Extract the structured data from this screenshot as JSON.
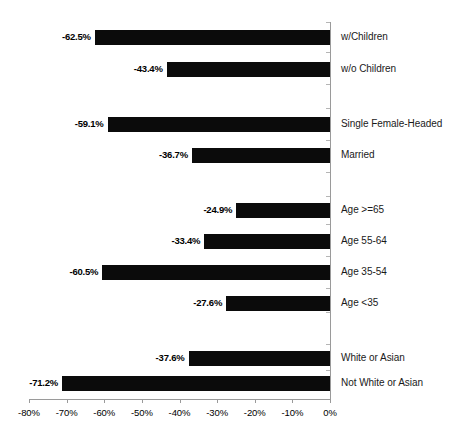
{
  "chart_data": {
    "type": "bar",
    "orientation": "horizontal",
    "title": "",
    "subtitle": "",
    "xlabel": "",
    "ylabel": "",
    "xlim": [
      -80,
      0
    ],
    "xticks": [
      -80,
      -70,
      -60,
      -50,
      -40,
      -30,
      -20,
      -10,
      0
    ],
    "xtick_labels": [
      "-80%",
      "-70%",
      "-60%",
      "-50%",
      "-40%",
      "-30%",
      "-20%",
      "-10%",
      "0%"
    ],
    "grid": false,
    "legend": "none",
    "bar_color": "#0b0b0b",
    "axis_color": "#9a9a9a",
    "categories": [
      "w/Children",
      "w/o Children",
      "Single Female-Headed",
      "Married",
      "Age >=65",
      "Age 55-64",
      "Age 35-54",
      "Age <35",
      "White or Asian",
      "Not White or Asian"
    ],
    "values": [
      -62.5,
      -43.4,
      -59.1,
      -36.7,
      -24.9,
      -33.4,
      -60.5,
      -27.6,
      -37.6,
      -71.2
    ],
    "value_labels": [
      "-62.5%",
      "-43.4%",
      "-59.1%",
      "-36.7%",
      "-24.9%",
      "-33.4%",
      "-60.5%",
      "-27.6%",
      "-37.6%",
      "-71.2%"
    ],
    "groups": [
      {
        "name": "children",
        "categories": [
          "w/Children",
          "w/o Children"
        ]
      },
      {
        "name": "marital-status",
        "categories": [
          "Single Female-Headed",
          "Married"
        ]
      },
      {
        "name": "age",
        "categories": [
          "Age >=65",
          "Age 55-64",
          "Age 35-54",
          "Age <35"
        ]
      },
      {
        "name": "race",
        "categories": [
          "White or Asian",
          "Not White or Asian"
        ]
      }
    ],
    "bars": [
      {
        "label": "w/Children",
        "value": -62.5,
        "value_label": "-62.5%",
        "top": 30
      },
      {
        "label": "w/o Children",
        "value": -43.4,
        "value_label": "-43.4%",
        "top": 62
      },
      {
        "label": "Single Female-Headed",
        "value": -59.1,
        "value_label": "-59.1%",
        "top": 117
      },
      {
        "label": "Married",
        "value": -36.7,
        "value_label": "-36.7%",
        "top": 148
      },
      {
        "label": "Age >=65",
        "value": -24.9,
        "value_label": "-24.9%",
        "top": 203
      },
      {
        "label": "Age 55-64",
        "value": -33.4,
        "value_label": "-33.4%",
        "top": 234
      },
      {
        "label": "Age 35-54",
        "value": -60.5,
        "value_label": "-60.5%",
        "top": 265
      },
      {
        "label": "Age <35",
        "value": -27.6,
        "value_label": "-27.6%",
        "top": 296
      },
      {
        "label": "White or Asian",
        "value": -37.6,
        "value_label": "-37.6%",
        "top": 351
      },
      {
        "label": "Not White or Asian",
        "value": -71.2,
        "value_label": "-71.2%",
        "top": 376
      }
    ]
  }
}
